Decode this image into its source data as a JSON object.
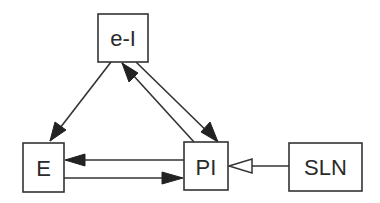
{
  "diagram": {
    "nodes": [
      {
        "id": "eI",
        "label": "e-I",
        "x": 98,
        "y": 14,
        "w": 50,
        "h": 48
      },
      {
        "id": "E",
        "label": "E",
        "x": 23,
        "y": 143,
        "w": 41,
        "h": 49
      },
      {
        "id": "PI",
        "label": "PI",
        "x": 184,
        "y": 142,
        "w": 44,
        "h": 48
      },
      {
        "id": "SLN",
        "label": "SLN",
        "x": 289,
        "y": 143,
        "w": 73,
        "h": 48
      }
    ],
    "edges": [
      {
        "from": "eI",
        "to": "E",
        "style": "filled-arrow"
      },
      {
        "from": "eI",
        "to": "PI",
        "style": "filled-arrow"
      },
      {
        "from": "PI",
        "to": "eI",
        "style": "filled-arrow"
      },
      {
        "from": "PI",
        "to": "E",
        "style": "filled-arrow"
      },
      {
        "from": "E",
        "to": "PI",
        "style": "filled-arrow"
      },
      {
        "from": "SLN",
        "to": "PI",
        "style": "hollow-arrow"
      }
    ],
    "colors": {
      "stroke": "#333333",
      "background": "#ffffff"
    }
  }
}
